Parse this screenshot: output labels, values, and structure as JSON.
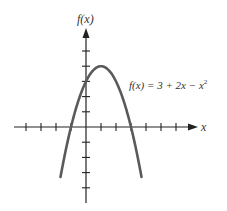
{
  "chart_data": {
    "type": "line",
    "title": "",
    "xlabel": "x",
    "ylabel": "f(x)",
    "equation_label": "f(x) = 3 + 2x − x²",
    "function": "3 + 2x - x^2",
    "xlim": [
      -4,
      7
    ],
    "ylim": [
      -5,
      6
    ],
    "x_ticks": [
      -4,
      -3,
      -2,
      -1,
      1,
      2,
      3,
      4,
      5,
      6
    ],
    "y_ticks": [
      -4,
      -3,
      -2,
      -1,
      1,
      2,
      3,
      4,
      5
    ],
    "vertex": [
      1,
      4
    ],
    "roots": [
      -1,
      3
    ],
    "y_intercept": 3,
    "x": [
      -1.7,
      -1.5,
      -1,
      -0.5,
      0,
      0.5,
      1,
      1.5,
      2,
      2.5,
      3,
      3.5,
      3.7
    ],
    "values": [
      -3.29,
      -2.25,
      0,
      1.75,
      3,
      3.75,
      4,
      3.75,
      3,
      1.75,
      0,
      -2.25,
      -3.29
    ],
    "grid": false,
    "legend": null,
    "colors": {
      "curve": "#5a5a5a",
      "axis": "#222222"
    }
  },
  "labels": {
    "ylabel_text": "f(x)",
    "xlabel_text": "x",
    "eq_prefix": "f(x) = 3 + 2x − x",
    "eq_exp": "2"
  }
}
